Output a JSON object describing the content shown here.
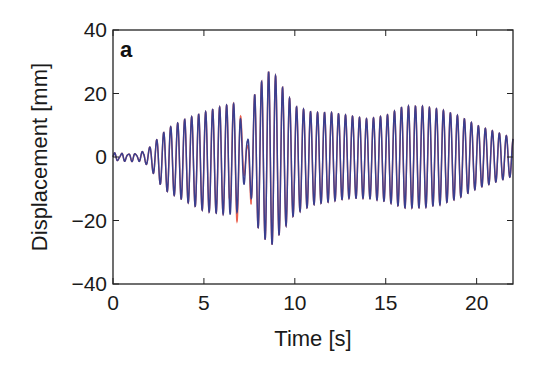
{
  "chart_data": {
    "type": "line",
    "panel_label": "a",
    "title": "",
    "xlabel": "Time [s]",
    "ylabel": "Displacement [mm]",
    "xlim": [
      0,
      22
    ],
    "ylim": [
      -40,
      40
    ],
    "xticks": [
      0,
      5,
      10,
      15,
      20
    ],
    "xtick_labels": [
      "0",
      "5",
      "10",
      "15",
      "20"
    ],
    "yticks": [
      -40,
      -20,
      0,
      20,
      40
    ],
    "ytick_labels": [
      "−40",
      "−20",
      "0",
      "20",
      "40"
    ],
    "grid": false,
    "legend": null,
    "oscillation_frequency_hz": 2.6,
    "series": [
      {
        "name": "measured",
        "color": "#3a3f8f",
        "envelope": {
          "t": [
            0,
            1.5,
            2.0,
            2.5,
            3.0,
            4.0,
            5.0,
            6.0,
            6.8,
            7.1,
            7.4,
            7.8,
            8.2,
            8.7,
            9.2,
            10.0,
            11.0,
            12.0,
            13.0,
            14.0,
            15.0,
            16.0,
            17.0,
            18.0,
            19.0,
            20.0,
            21.0,
            22.0
          ],
          "upper": [
            1,
            1,
            3,
            6,
            9,
            12,
            14,
            16,
            17,
            10,
            5,
            20,
            24,
            28,
            23,
            16,
            14,
            14,
            13,
            12,
            13,
            16,
            16,
            15,
            13,
            10,
            8,
            6
          ],
          "lower": [
            -1,
            -1,
            -3,
            -8,
            -11,
            -14,
            -17,
            -18,
            -18,
            -10,
            -6,
            -20,
            -25,
            -28,
            -24,
            -18,
            -15,
            -14,
            -13,
            -13,
            -14,
            -16,
            -16,
            -15,
            -13,
            -10,
            -8,
            -6
          ]
        }
      },
      {
        "name": "simulated",
        "color": "#e8442e",
        "note": "mostly overlaps measured; visible near t = 6.5-7.5 s"
      }
    ]
  }
}
